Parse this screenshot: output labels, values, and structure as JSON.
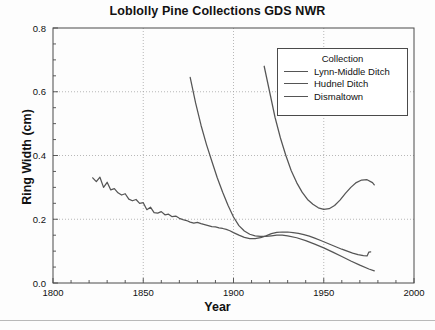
{
  "chart_data": {
    "type": "line",
    "title": "Loblolly Pine Collections GDS NWR",
    "xlabel": "Year",
    "ylabel": "Ring Width (cm)",
    "xlim": [
      1800,
      2000
    ],
    "ylim": [
      0.0,
      0.8
    ],
    "xticks": [
      1800,
      1850,
      1900,
      1950,
      2000
    ],
    "yticks": [
      "0.0",
      "0.2",
      "0.4",
      "0.6",
      "0.8"
    ],
    "xminor_step": 10,
    "yminor_step": 0.05,
    "grid": "dotted major gridlines both axes",
    "legend_position": "upper right inside plot",
    "legend_title": "Collection",
    "line_color": "#555555",
    "series": [
      {
        "name": "Lynn-Middle Ditch",
        "points": [
          [
            1917,
            0.68
          ],
          [
            1920,
            0.6
          ],
          [
            1923,
            0.52
          ],
          [
            1926,
            0.455
          ],
          [
            1929,
            0.4
          ],
          [
            1932,
            0.352
          ],
          [
            1935,
            0.315
          ],
          [
            1938,
            0.285
          ],
          [
            1941,
            0.262
          ],
          [
            1944,
            0.247
          ],
          [
            1947,
            0.236
          ],
          [
            1950,
            0.231
          ],
          [
            1953,
            0.233
          ],
          [
            1956,
            0.243
          ],
          [
            1959,
            0.26
          ],
          [
            1962,
            0.281
          ],
          [
            1965,
            0.3
          ],
          [
            1968,
            0.315
          ],
          [
            1971,
            0.323
          ],
          [
            1974,
            0.324
          ],
          [
            1977,
            0.315
          ],
          [
            1978,
            0.308
          ]
        ]
      },
      {
        "name": "Hudnel Ditch",
        "points": [
          [
            1876,
            0.645
          ],
          [
            1879,
            0.565
          ],
          [
            1882,
            0.495
          ],
          [
            1885,
            0.435
          ],
          [
            1888,
            0.382
          ],
          [
            1891,
            0.33
          ],
          [
            1894,
            0.285
          ],
          [
            1897,
            0.243
          ],
          [
            1900,
            0.207
          ],
          [
            1903,
            0.18
          ],
          [
            1906,
            0.163
          ],
          [
            1909,
            0.153
          ],
          [
            1912,
            0.148
          ],
          [
            1915,
            0.146
          ],
          [
            1918,
            0.146
          ],
          [
            1921,
            0.148
          ],
          [
            1924,
            0.15
          ],
          [
            1927,
            0.15
          ],
          [
            1930,
            0.148
          ],
          [
            1935,
            0.142
          ],
          [
            1940,
            0.133
          ],
          [
            1945,
            0.122
          ],
          [
            1950,
            0.11
          ],
          [
            1955,
            0.097
          ],
          [
            1960,
            0.083
          ],
          [
            1965,
            0.069
          ],
          [
            1970,
            0.056
          ],
          [
            1975,
            0.044
          ],
          [
            1978,
            0.038
          ]
        ]
      },
      {
        "name": "Dismaltown",
        "points": [
          [
            1822,
            0.33
          ],
          [
            1824,
            0.318
          ],
          [
            1826,
            0.332
          ],
          [
            1828,
            0.3
          ],
          [
            1830,
            0.316
          ],
          [
            1832,
            0.292
          ],
          [
            1834,
            0.296
          ],
          [
            1836,
            0.283
          ],
          [
            1838,
            0.276
          ],
          [
            1840,
            0.28
          ],
          [
            1842,
            0.263
          ],
          [
            1844,
            0.258
          ],
          [
            1846,
            0.262
          ],
          [
            1848,
            0.25
          ],
          [
            1850,
            0.252
          ],
          [
            1852,
            0.23
          ],
          [
            1854,
            0.238
          ],
          [
            1856,
            0.221
          ],
          [
            1858,
            0.219
          ],
          [
            1860,
            0.224
          ],
          [
            1862,
            0.214
          ],
          [
            1864,
            0.216
          ],
          [
            1866,
            0.208
          ],
          [
            1868,
            0.21
          ],
          [
            1870,
            0.203
          ],
          [
            1872,
            0.199
          ],
          [
            1874,
            0.196
          ],
          [
            1876,
            0.191
          ],
          [
            1878,
            0.188
          ],
          [
            1880,
            0.19
          ],
          [
            1882,
            0.186
          ],
          [
            1884,
            0.183
          ],
          [
            1886,
            0.18
          ],
          [
            1888,
            0.177
          ],
          [
            1890,
            0.176
          ],
          [
            1892,
            0.173
          ],
          [
            1894,
            0.171
          ],
          [
            1896,
            0.168
          ],
          [
            1898,
            0.164
          ],
          [
            1900,
            0.158
          ],
          [
            1903,
            0.15
          ],
          [
            1906,
            0.143
          ],
          [
            1909,
            0.139
          ],
          [
            1912,
            0.139
          ],
          [
            1915,
            0.142
          ],
          [
            1918,
            0.148
          ],
          [
            1921,
            0.155
          ],
          [
            1924,
            0.159
          ],
          [
            1927,
            0.16
          ],
          [
            1930,
            0.16
          ],
          [
            1933,
            0.158
          ],
          [
            1936,
            0.156
          ],
          [
            1939,
            0.152
          ],
          [
            1942,
            0.147
          ],
          [
            1945,
            0.141
          ],
          [
            1948,
            0.134
          ],
          [
            1951,
            0.127
          ],
          [
            1954,
            0.12
          ],
          [
            1957,
            0.113
          ],
          [
            1960,
            0.106
          ],
          [
            1963,
            0.1
          ],
          [
            1966,
            0.094
          ],
          [
            1969,
            0.089
          ],
          [
            1972,
            0.086
          ],
          [
            1974,
            0.085
          ],
          [
            1975,
            0.097
          ],
          [
            1976,
            0.098
          ]
        ]
      }
    ]
  }
}
